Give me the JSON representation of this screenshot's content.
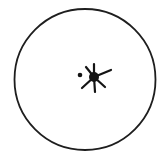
{
  "diagram": {
    "type": "circle-with-burst-symbol",
    "colors": {
      "stroke": "#1e1e1e",
      "fill": "#141414",
      "background": "#ffffff"
    },
    "circle": {
      "cx": 85,
      "cy": 79.5,
      "r": 70.5,
      "stroke_width": 1.8
    },
    "dot": {
      "cx": 80,
      "cy": 75,
      "r": 2.3
    },
    "burst": {
      "cx": 94,
      "cy": 77,
      "r": 5,
      "rays": [
        {
          "x2": 94,
          "y2": 64
        },
        {
          "x2": 86,
          "y2": 67
        },
        {
          "x2": 111,
          "y2": 70
        },
        {
          "x2": 82,
          "y2": 88
        },
        {
          "x2": 95,
          "y2": 92
        },
        {
          "x2": 105,
          "y2": 87
        }
      ]
    }
  }
}
